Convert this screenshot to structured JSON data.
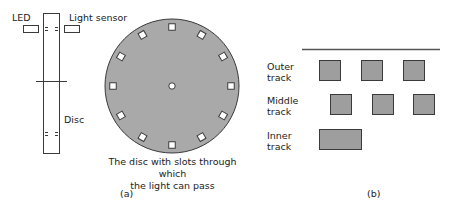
{
  "panel_a": {
    "side_view": {
      "led_label": "LED",
      "sensor_label": "Light sensor",
      "disc_label": "Disc"
    },
    "disc": {
      "slot_count": 12,
      "caption_line1": "The disc with slots through which",
      "caption_line2": "the light can pass"
    },
    "panel_label": "(a)"
  },
  "panel_b": {
    "tracks": [
      {
        "label_line1": "Outer",
        "label_line2": "track",
        "slots": 3
      },
      {
        "label_line1": "Middle",
        "label_line2": "track",
        "slots": 3
      },
      {
        "label_line1": "Inner",
        "label_line2": "track",
        "slots": 1
      }
    ],
    "panel_label": "(b)"
  },
  "colors": {
    "disc_fill": "#a9a9a9",
    "slot_fill": "#9e9e9e",
    "stroke": "#3a3a3a"
  }
}
